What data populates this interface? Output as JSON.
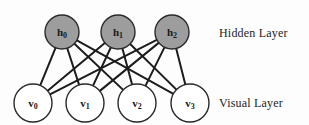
{
  "diagram": {
    "type": "bipartite-neural-network",
    "background_color": "#fdfdfd",
    "edge_color": "#1c1c1c",
    "layers": [
      {
        "id": "hidden",
        "label": "Hidden Layer",
        "fill_color": "#9d9d9d",
        "stroke_color": "#2a2a2a",
        "radius": 17,
        "center_y": 32,
        "nodes": [
          {
            "id": "h0",
            "base": "h",
            "sub": "0",
            "cx": 62,
            "cy": 32
          },
          {
            "id": "h1",
            "base": "h",
            "sub": "1",
            "cx": 118,
            "cy": 32
          },
          {
            "id": "h2",
            "base": "h",
            "sub": "2",
            "cx": 172,
            "cy": 32
          }
        ]
      },
      {
        "id": "visual",
        "label": "Visual Layer",
        "fill_color": "#ffffff",
        "stroke_color": "#2a2a2a",
        "radius": 19,
        "center_y": 103,
        "nodes": [
          {
            "id": "v0",
            "base": "v",
            "sub": "0",
            "cx": 33,
            "cy": 103
          },
          {
            "id": "v1",
            "base": "v",
            "sub": "1",
            "cx": 85,
            "cy": 103
          },
          {
            "id": "v2",
            "base": "v",
            "sub": "2",
            "cx": 137,
            "cy": 103
          },
          {
            "id": "v3",
            "base": "v",
            "sub": "3",
            "cx": 190,
            "cy": 103
          }
        ]
      }
    ],
    "edges": [
      {
        "from": "h0",
        "to": "v0"
      },
      {
        "from": "h0",
        "to": "v1"
      },
      {
        "from": "h0",
        "to": "v2"
      },
      {
        "from": "h0",
        "to": "v3"
      },
      {
        "from": "h1",
        "to": "v0"
      },
      {
        "from": "h1",
        "to": "v1"
      },
      {
        "from": "h1",
        "to": "v2"
      },
      {
        "from": "h1",
        "to": "v3"
      },
      {
        "from": "h2",
        "to": "v0"
      },
      {
        "from": "h2",
        "to": "v1"
      },
      {
        "from": "h2",
        "to": "v2"
      },
      {
        "from": "h2",
        "to": "v3"
      }
    ]
  }
}
